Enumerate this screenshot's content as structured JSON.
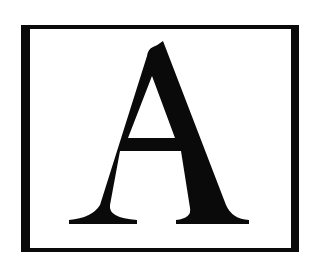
{
  "image": {
    "letter": "A",
    "colors": {
      "background": "#ffffff",
      "ink": "#0a0a0a"
    }
  }
}
